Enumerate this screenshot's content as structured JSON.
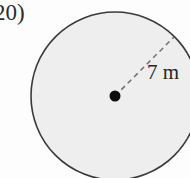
{
  "figure": {
    "problem_number": "20)",
    "radius_label": "7 m",
    "shape": "circle",
    "measurement": {
      "quantity": "radius",
      "value": 7,
      "unit": "m"
    },
    "colors": {
      "background": "#fdfdfd",
      "circle_fill": "#eeeeee",
      "circle_stroke": "#3a3a3a",
      "radius_line": "#6e6e6e",
      "center_dot": "#0d0d0d",
      "text": "#2b2b2b"
    },
    "geometry": {
      "center_x": 115,
      "center_y": 96,
      "radius_px": 84,
      "radius_endpoint_x": 174,
      "radius_endpoint_y": 37,
      "center_dot_radius_px": 5.5,
      "stroke_width": 1.6,
      "dash_pattern": "5 4"
    },
    "icons": {
      "radius_line": "dashed-radius-line",
      "center": "center-point-dot"
    }
  }
}
